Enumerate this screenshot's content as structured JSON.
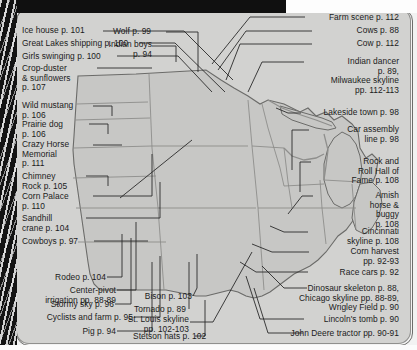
{
  "page": {
    "background_color": "#d2d2d0",
    "map_fill_color": "#c7c7c5",
    "map_outline_color": "#6b6b69",
    "label_color": "#1b1b1b",
    "scan_border_color": "#121212"
  },
  "labels": {
    "left": [
      {
        "id": "ice-house",
        "text": "Ice house p. 101"
      },
      {
        "id": "great-lakes",
        "text": "Great Lakes shipping p. 100"
      },
      {
        "id": "girls-swinging",
        "text": "Girls swinging p. 100"
      },
      {
        "id": "crop-duster",
        "text": "Crop-duster\n& sunflowers\np. 107"
      },
      {
        "id": "wild-mustang",
        "text": "Wild mustang\np. 106"
      },
      {
        "id": "prairie-dog",
        "text": "Prairie dog\np. 106"
      },
      {
        "id": "crazy-horse",
        "text": "Crazy Horse\nMemorial\np. 111"
      },
      {
        "id": "chimney-rock",
        "text": "Chimney\nRock p. 105"
      },
      {
        "id": "corn-palace",
        "text": "Corn Palace\np. 110"
      },
      {
        "id": "sandhill-crane",
        "text": "Sandhill\ncrane p. 104"
      },
      {
        "id": "cowboys",
        "text": "Cowboys p. 97"
      }
    ],
    "bottom_left": [
      {
        "id": "rodeo",
        "text": "Rodeo p. 104"
      },
      {
        "id": "center-pivot",
        "text": "Center-pivot\nirrigation pp. 88-89"
      },
      {
        "id": "stormy-sky",
        "text": "Stormy sky p. 96"
      },
      {
        "id": "cyclists-farm",
        "text": "Cyclists and farm p. 95"
      },
      {
        "id": "pig",
        "text": "Pig p. 94"
      }
    ],
    "top_center": [
      {
        "id": "wolf",
        "text": "Wolf p. 99"
      },
      {
        "id": "indian-boys",
        "text": "Indian boys\np. 94"
      }
    ],
    "bottom_center": [
      {
        "id": "bison",
        "text": "Bison p. 103"
      },
      {
        "id": "tornado",
        "text": "Tornado p. 89"
      },
      {
        "id": "st-louis",
        "text": "St. Louis skyline\npp. 102-103"
      },
      {
        "id": "stetson-hats",
        "text": "Stetson hats p. 102"
      }
    ],
    "right": [
      {
        "id": "farm-scene",
        "text": "Farm scene p. 112"
      },
      {
        "id": "cows",
        "text": "Cows p. 88"
      },
      {
        "id": "cow",
        "text": "Cow p. 112"
      },
      {
        "id": "indian-dancer",
        "text": "Indian dancer\np. 89,\nMilwaukee skyline\npp. 112-113"
      },
      {
        "id": "lakeside-town",
        "text": "Lakeside town p. 98"
      },
      {
        "id": "car-assembly",
        "text": "Car assembly\nline p. 98"
      },
      {
        "id": "rock-roll",
        "text": "Rock and\nRoll Hall of\nFame p. 108"
      },
      {
        "id": "amish",
        "text": "Amish\nhorse &\nbuggy\np. 108"
      },
      {
        "id": "cincinnati",
        "text": "Cincinnati\nskyline p. 108"
      },
      {
        "id": "corn-harvest",
        "text": "Corn harvest\npp. 92-93"
      },
      {
        "id": "race-cars",
        "text": "Race cars p. 92"
      }
    ],
    "bottom_right": [
      {
        "id": "dinosaur-chicago",
        "text": "Dinosaur skeleton p. 88,\nChicago skyline pp. 88-89,\nWrigley Field p. 90"
      },
      {
        "id": "lincolns-tomb",
        "text": "Lincoln's tomb p. 90"
      },
      {
        "id": "john-deere",
        "text": "John Deere tractor pp. 90-91"
      }
    ]
  }
}
